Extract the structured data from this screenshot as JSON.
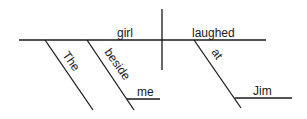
{
  "diagram": {
    "type": "sentence-diagram",
    "subject": "girl",
    "predicate": "laughed",
    "modifiers": {
      "article": "The",
      "subject_preposition": "beside",
      "subject_preposition_object": "me",
      "verb_preposition": "at",
      "verb_preposition_object": "Jim"
    }
  }
}
